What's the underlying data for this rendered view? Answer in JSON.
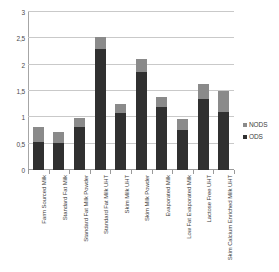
{
  "chart_data": {
    "type": "bar",
    "subtype": "stacked-vertical",
    "title": "",
    "xlabel": "",
    "ylabel": "",
    "ylim": [
      0,
      3
    ],
    "ytick_values": [
      0,
      0.5,
      1,
      1.5,
      2,
      2.5,
      3
    ],
    "ytick_labels": [
      "0",
      "0,5",
      "1",
      "1,5",
      "2",
      "2,5",
      "3"
    ],
    "decimal_separator": ",",
    "grid": true,
    "grid_axis": "y",
    "legend_position": "right",
    "categories": [
      "Farm Sourced Milk",
      "Standard Fat Milk",
      "Standard Fat Milk Powder",
      "Standard Fat Milk UHT",
      "Skim Milk UHT",
      "Skim Milk Powder",
      "Evaporated Milk",
      "Low Fat Evaporated Milk",
      "Lactose Free UHT",
      "Skim Calcium Enriched Milk UHT"
    ],
    "series": [
      {
        "name": "ODS",
        "color": "#303030",
        "values": [
          0.53,
          0.51,
          0.81,
          2.3,
          1.08,
          1.87,
          1.19,
          0.76,
          1.35,
          1.1
        ]
      },
      {
        "name": "NODS",
        "color": "#8a8a8a",
        "values": [
          0.29,
          0.22,
          0.18,
          0.23,
          0.18,
          0.23,
          0.19,
          0.21,
          0.28,
          0.4
        ]
      }
    ],
    "totals": [
      0.82,
      0.73,
      0.99,
      2.53,
      1.26,
      2.1,
      1.38,
      0.97,
      1.63,
      1.5
    ]
  },
  "legend": {
    "items": [
      {
        "label": "NODS",
        "color": "#8a8a8a"
      },
      {
        "label": "ODS",
        "color": "#303030"
      }
    ]
  }
}
